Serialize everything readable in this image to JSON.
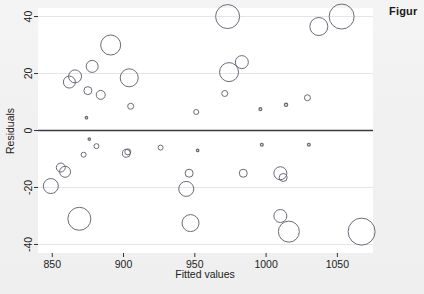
{
  "figure": {
    "caption_text": "Figur",
    "caption_full_visible": "Figur"
  },
  "chart_data": {
    "type": "scatter",
    "title": "",
    "xlabel": "Fitted values",
    "ylabel": "Residuals",
    "xlim": [
      840,
      1075
    ],
    "ylim": [
      -43,
      43
    ],
    "xticks": [
      850,
      900,
      950,
      1000,
      1050
    ],
    "xtick_labels": [
      "850",
      "900",
      "950",
      "1000",
      "1050"
    ],
    "yticks": [
      40,
      20,
      0,
      -20,
      -40
    ],
    "ytick_labels": [
      "40",
      "20",
      "0",
      "-20",
      "-40"
    ],
    "grid": true,
    "gridlines_y": [
      40,
      20,
      -20,
      -40
    ],
    "reference_line_y": 0,
    "legend": "none",
    "marker": "open-circle",
    "size_encodes": "weight",
    "colors": {
      "marker_stroke": "#6b6b78",
      "reference_line": "#3a3a46",
      "gridline": "#e4e4ea",
      "panel_background": "#ffffff",
      "page_background": "#f1f1f1",
      "text": "#222222"
    },
    "points": [
      {
        "x": 849,
        "y": -19.5,
        "r": 7.5
      },
      {
        "x": 856,
        "y": -13.0,
        "r": 4.5
      },
      {
        "x": 859,
        "y": -14.5,
        "r": 5.5
      },
      {
        "x": 862,
        "y": 17.0,
        "r": 6.0
      },
      {
        "x": 866,
        "y": 19.0,
        "r": 6.5
      },
      {
        "x": 869,
        "y": -31.0,
        "r": 11.5
      },
      {
        "x": 872,
        "y": -8.5,
        "r": 2.5
      },
      {
        "x": 874,
        "y": 4.5,
        "r": 1.2
      },
      {
        "x": 875,
        "y": 14.0,
        "r": 4.0
      },
      {
        "x": 876,
        "y": -3.0,
        "r": 1.2
      },
      {
        "x": 878,
        "y": 22.5,
        "r": 6.0
      },
      {
        "x": 881,
        "y": -5.5,
        "r": 2.5
      },
      {
        "x": 884,
        "y": 12.5,
        "r": 4.5
      },
      {
        "x": 891,
        "y": 30.0,
        "r": 10.0
      },
      {
        "x": 902,
        "y": -8.0,
        "r": 4.0
      },
      {
        "x": 903,
        "y": -7.5,
        "r": 3.0
      },
      {
        "x": 904,
        "y": 18.5,
        "r": 9.0
      },
      {
        "x": 905,
        "y": 8.5,
        "r": 3.0
      },
      {
        "x": 926,
        "y": -6.0,
        "r": 2.5
      },
      {
        "x": 944,
        "y": -20.5,
        "r": 7.5
      },
      {
        "x": 946,
        "y": -15.0,
        "r": 4.0
      },
      {
        "x": 947,
        "y": -32.5,
        "r": 8.5
      },
      {
        "x": 951,
        "y": 6.5,
        "r": 2.5
      },
      {
        "x": 952,
        "y": -7.0,
        "r": 1.2
      },
      {
        "x": 971,
        "y": 13.0,
        "r": 3.0
      },
      {
        "x": 973,
        "y": 40.0,
        "r": 12.0
      },
      {
        "x": 974,
        "y": 20.5,
        "r": 9.5
      },
      {
        "x": 983,
        "y": 24.0,
        "r": 6.5
      },
      {
        "x": 984,
        "y": -15.0,
        "r": 4.0
      },
      {
        "x": 996,
        "y": 7.5,
        "r": 1.4
      },
      {
        "x": 997,
        "y": -5.0,
        "r": 1.4
      },
      {
        "x": 1010,
        "y": -15.0,
        "r": 6.5
      },
      {
        "x": 1010,
        "y": -30.0,
        "r": 6.5
      },
      {
        "x": 1012,
        "y": -16.5,
        "r": 4.0
      },
      {
        "x": 1014,
        "y": 9.0,
        "r": 1.6
      },
      {
        "x": 1016,
        "y": -35.5,
        "r": 10.5
      },
      {
        "x": 1029,
        "y": 11.5,
        "r": 3.0
      },
      {
        "x": 1030,
        "y": -5.0,
        "r": 1.4
      },
      {
        "x": 1037,
        "y": 36.5,
        "r": 9.0
      },
      {
        "x": 1053,
        "y": 40.0,
        "r": 12.5
      },
      {
        "x": 1067,
        "y": -35.5,
        "r": 13.5
      }
    ]
  },
  "axes_geometry": {
    "panel_left_px": 38,
    "panel_right_px": 373,
    "panel_top_px": 8,
    "panel_bottom_px": 253
  }
}
